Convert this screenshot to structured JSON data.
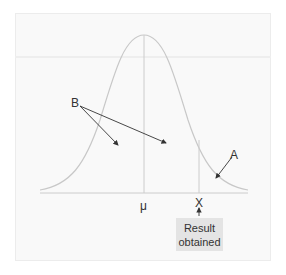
{
  "diagram": {
    "type": "normal-distribution",
    "labels": {
      "B": "B",
      "A": "A",
      "mean": "μ",
      "x": "X"
    },
    "result_box": {
      "line1": "Result",
      "line2": "obtained"
    },
    "colors": {
      "curve": "#c8c8c8",
      "axis": "#c8c8c8",
      "arrow": "#333333",
      "panel": "#f9f9f9",
      "box": "#e4e4e4"
    }
  }
}
